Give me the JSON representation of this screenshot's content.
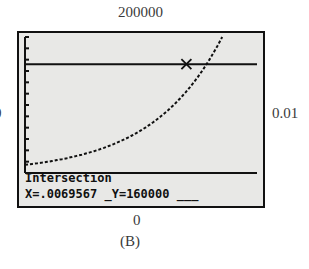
{
  "chart_data": {
    "type": "line",
    "title": "",
    "caption": "(B)",
    "window": {
      "xmin": 0,
      "xmax": 0.01,
      "ymin": 0,
      "ymax": 200000
    },
    "xlabel": "",
    "ylabel": "",
    "series": [
      {
        "name": "curve",
        "style": "dotted",
        "x": [
          0,
          0.002,
          0.004,
          0.006,
          0.0069567,
          0.0085
        ],
        "y": [
          12000,
          30000,
          70000,
          125000,
          160000,
          200000
        ]
      },
      {
        "name": "horizontal line",
        "style": "solid",
        "x": [
          0,
          0.01
        ],
        "y": [
          160000,
          160000
        ]
      }
    ],
    "intersection": {
      "x": 0.0069567,
      "y": 160000
    },
    "grid": false,
    "y_ticks": 12
  },
  "labels": {
    "ymax": "200000",
    "ymin": "0",
    "xmin": "0",
    "xmax": "0.01",
    "caption": "(B)"
  },
  "screen": {
    "line1": "Intersection",
    "line2": "X=.0069567 _Y=160000 ___"
  }
}
